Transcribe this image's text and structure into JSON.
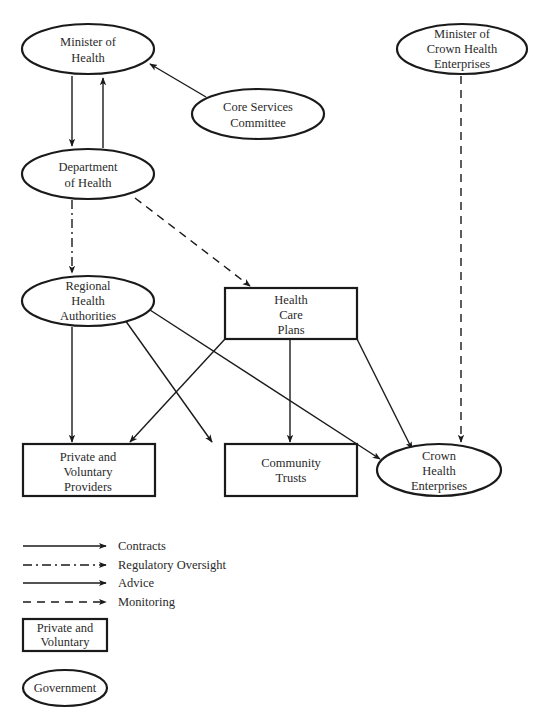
{
  "diagram": {
    "nodes": {
      "minister_of_health": {
        "shape": "ellipse",
        "lines": [
          "Minister of",
          "Health"
        ]
      },
      "core_services_committee": {
        "shape": "ellipse",
        "lines": [
          "Core Services",
          "Committee"
        ]
      },
      "department_of_health": {
        "shape": "ellipse",
        "lines": [
          "Department",
          "of Health"
        ]
      },
      "minister_crown_health": {
        "shape": "ellipse",
        "lines": [
          "Minister of",
          "Crown Health",
          "Enterprises"
        ]
      },
      "regional_health_authorities": {
        "shape": "ellipse",
        "lines": [
          "Regional",
          "Health",
          "Authorities"
        ]
      },
      "health_care_plans": {
        "shape": "rectangle",
        "lines": [
          "Health",
          "Care",
          "Plans"
        ]
      },
      "private_voluntary_providers": {
        "shape": "rectangle",
        "lines": [
          "Private and",
          "Voluntary",
          "Providers"
        ]
      },
      "community_trusts": {
        "shape": "rectangle",
        "lines": [
          "Community",
          "Trusts"
        ]
      },
      "crown_health_enterprises": {
        "shape": "ellipse",
        "lines": [
          "Crown",
          "Health",
          "Enterprises"
        ]
      }
    },
    "edges": [
      {
        "from": "Minister of Health",
        "to": "Department of Health",
        "type": "contracts"
      },
      {
        "from": "Department of Health",
        "to": "Minister of Health",
        "type": "advice"
      },
      {
        "from": "Core Services Committee",
        "to": "Minister of Health",
        "type": "advice"
      },
      {
        "from": "Department of Health",
        "to": "Regional Health Authorities",
        "type": "regulatory_oversight"
      },
      {
        "from": "Department of Health",
        "to": "Health Care Plans",
        "type": "monitoring"
      },
      {
        "from": "Minister of Crown Health Enterprises",
        "to": "Crown Health Enterprises",
        "type": "monitoring"
      },
      {
        "from": "Regional Health Authorities",
        "to": "Private and Voluntary Providers",
        "type": "contracts"
      },
      {
        "from": "Regional Health Authorities",
        "to": "Community Trusts",
        "type": "contracts"
      },
      {
        "from": "Regional Health Authorities",
        "to": "Crown Health Enterprises",
        "type": "contracts"
      },
      {
        "from": "Health Care Plans",
        "to": "Private and Voluntary Providers",
        "type": "contracts"
      },
      {
        "from": "Health Care Plans",
        "to": "Community Trusts",
        "type": "contracts"
      },
      {
        "from": "Health Care Plans",
        "to": "Crown Health Enterprises",
        "type": "contracts"
      }
    ],
    "legend": {
      "lines": [
        {
          "style": "solid",
          "label": "Contracts"
        },
        {
          "style": "dash-dot",
          "label": "Regulatory Oversight"
        },
        {
          "style": "solid",
          "label": "Advice"
        },
        {
          "style": "dashed",
          "label": "Monitoring"
        }
      ],
      "box": {
        "shape": "rectangle",
        "lines": [
          "Private and",
          "Voluntary"
        ]
      },
      "ellipse": {
        "shape": "ellipse",
        "label": "Government"
      }
    },
    "colors": {
      "stroke": "#1a1a1a",
      "text": "#2a2a2a",
      "background": "#ffffff"
    }
  }
}
